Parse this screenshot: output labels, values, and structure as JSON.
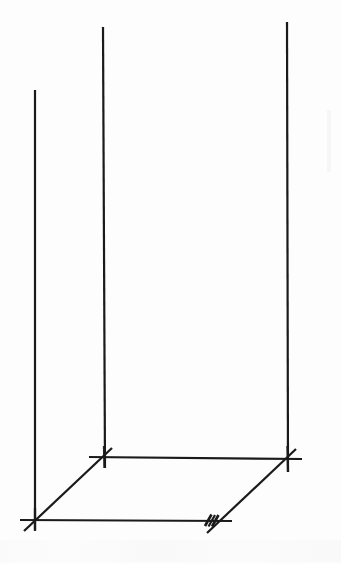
{
  "figure": {
    "title": "3D oblique projection line drawing of an open rectangular frame",
    "kind": "technical-line-drawing",
    "background_color": "#fdfdfd",
    "stroke_color": "#1a1a1a",
    "canvas": {
      "width": 341,
      "height": 564
    },
    "vertices": {
      "front_bottom_left": {
        "x": 35,
        "y": 519
      },
      "back_bottom_left": {
        "x": 104,
        "y": 457
      },
      "back_bottom_right": {
        "x": 287,
        "y": 458
      },
      "front_bottom_right": {
        "x": 218,
        "y": 521
      },
      "front_top_left": {
        "x": 35,
        "y": 90
      },
      "back_top_left": {
        "x": 104,
        "y": 27
      },
      "back_top_right": {
        "x": 287,
        "y": 22
      }
    },
    "strokes": [
      {
        "name": "left-front-vertical-edge",
        "type": "line",
        "x1": 35,
        "y1": 90,
        "x2": 35,
        "y2": 530,
        "width": 2.2
      },
      {
        "name": "center-back-vertical-edge",
        "type": "line",
        "x1": 103,
        "y1": 27,
        "x2": 105,
        "y2": 468,
        "width": 2.2
      },
      {
        "name": "right-back-vertical-edge",
        "type": "line",
        "x1": 287,
        "y1": 22,
        "x2": 288,
        "y2": 472,
        "width": 2.2
      },
      {
        "name": "front-bottom-horizontal-edge",
        "type": "line",
        "x1": 20,
        "y1": 520,
        "x2": 232,
        "y2": 521,
        "width": 2.2
      },
      {
        "name": "back-bottom-horizontal-edge",
        "type": "line",
        "x1": 89,
        "y1": 457,
        "x2": 302,
        "y2": 459,
        "width": 2.2
      },
      {
        "name": "left-bottom-diagonal-edge",
        "type": "line",
        "x1": 24,
        "y1": 531,
        "x2": 112,
        "y2": 448,
        "width": 2.2
      },
      {
        "name": "right-bottom-diagonal-edge",
        "type": "line",
        "x1": 207,
        "y1": 533,
        "x2": 296,
        "y2": 449,
        "width": 2.2
      }
    ],
    "tick_marks": [
      {
        "name": "double-tick-front-bottom-right",
        "count": 2,
        "location": {
          "x": 214,
          "y": 521
        },
        "description": "pair of short slash hatch marks on the front bottom edge at the right diagonal intersection"
      }
    ],
    "intersection_markers": [
      {
        "name": "corner-cross-front-bottom-left",
        "x": 35,
        "y": 519
      },
      {
        "name": "corner-cross-back-bottom-left",
        "x": 104,
        "y": 457
      },
      {
        "name": "corner-cross-back-bottom-right",
        "x": 287,
        "y": 458
      }
    ],
    "artifacts": [
      {
        "name": "paper-bleed-smudge-right",
        "x": 327,
        "y": 110,
        "width": 5,
        "height": 60
      },
      {
        "name": "paper-bleed-text-bottom",
        "x": 0,
        "y": 538,
        "width": 341,
        "height": 24
      }
    ]
  }
}
